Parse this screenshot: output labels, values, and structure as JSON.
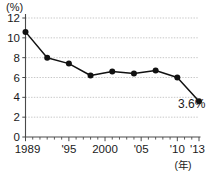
{
  "chart_data": {
    "type": "line",
    "title": "",
    "subtitle": "",
    "xlabel": "(年)",
    "ylabel": "(%)",
    "x": [
      1989,
      1992,
      1995,
      1998,
      2001,
      2004,
      2007,
      2010,
      2013
    ],
    "values": [
      10.6,
      8.0,
      7.4,
      6.2,
      6.6,
      6.4,
      6.7,
      6.0,
      3.6
    ],
    "series": [
      {
        "name": "",
        "values": [
          10.6,
          8.0,
          7.4,
          6.2,
          6.6,
          6.4,
          6.7,
          6.0,
          3.6
        ]
      }
    ],
    "xlim": [
      1989,
      2013
    ],
    "ylim": [
      0,
      12
    ],
    "y_ticks": [
      0,
      2,
      4,
      6,
      8,
      10,
      12
    ],
    "y_tick_labels": [
      "0",
      "2",
      "4",
      "6",
      "8",
      "10",
      "12"
    ],
    "x_tick_years": [
      1989,
      1990,
      1991,
      1992,
      1993,
      1994,
      1995,
      1996,
      1997,
      1998,
      1999,
      2000,
      2001,
      2002,
      2003,
      2004,
      2005,
      2006,
      2007,
      2008,
      2009,
      2010,
      2011,
      2012,
      2013
    ],
    "x_labeled_ticks": [
      {
        "year": 1989,
        "label": "1989"
      },
      {
        "year": 1995,
        "label": "'95"
      },
      {
        "year": 2000,
        "label": "2000"
      },
      {
        "year": 2005,
        "label": "'05"
      },
      {
        "year": 2010,
        "label": "'10"
      },
      {
        "year": 2013,
        "label": "'13"
      }
    ],
    "annotations": [
      {
        "text": "3.6%",
        "x": 2012,
        "y": 2.9
      }
    ],
    "grid": true,
    "grid_axis": "y",
    "legend": false,
    "legend_position": "none",
    "marker": "circle",
    "colors": {
      "line": "#111111",
      "marker": "#111111",
      "gridline": "#b9b9b9",
      "axis": "#4a4a4a",
      "text": "#1a1a1a",
      "background": "#ffffff"
    }
  }
}
